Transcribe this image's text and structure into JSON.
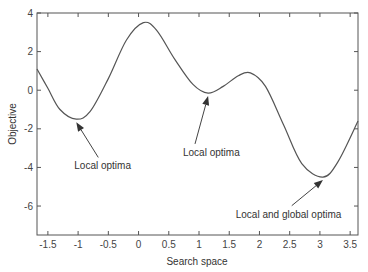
{
  "chart_data": {
    "type": "line",
    "title": "",
    "xlabel": "Search space",
    "ylabel": "Objective",
    "xlim": [
      -1.68,
      3.63
    ],
    "ylim": [
      -7.5,
      4
    ],
    "xticks": [
      -1.5,
      -1,
      -0.5,
      0,
      0.5,
      1,
      1.5,
      2,
      2.5,
      3,
      3.5
    ],
    "xtick_labels": [
      "-1.5",
      "-1",
      "-0.5",
      "0",
      "0.5",
      "1",
      "1.5",
      "2",
      "2.5",
      "3",
      "3.5"
    ],
    "yticks": [
      4,
      2,
      0,
      -2,
      -4,
      -6
    ],
    "ytick_labels": [
      "4",
      "2",
      "0",
      "-2",
      "-4",
      "-6"
    ],
    "grid": false,
    "legend": null,
    "series": [
      {
        "name": "objective",
        "color": "#555555",
        "x": [
          -1.68,
          -1.5,
          -1.3,
          -1.03,
          -0.8,
          -0.5,
          -0.2,
          0.08,
          0.3,
          0.6,
          0.9,
          1.15,
          1.4,
          1.65,
          1.85,
          2.1,
          2.4,
          2.7,
          3.05,
          3.3,
          3.63
        ],
        "y": [
          1.1,
          0.1,
          -1.0,
          -1.5,
          -1.1,
          0.6,
          2.6,
          3.5,
          3.1,
          1.6,
          0.3,
          -0.15,
          0.2,
          0.75,
          0.9,
          0.2,
          -1.8,
          -3.8,
          -4.5,
          -3.7,
          -1.6
        ]
      }
    ],
    "annotations": [
      {
        "text": "Local optima",
        "point": [
          -1.03,
          -1.5
        ],
        "text_pos": [
          -0.6,
          -4.0
        ]
      },
      {
        "text": "Local optima",
        "point": [
          1.15,
          -0.15
        ],
        "text_pos": [
          1.0,
          -3.3
        ]
      },
      {
        "text": "Local and global optima",
        "point": [
          3.05,
          -4.5
        ],
        "text_pos": [
          2.6,
          -6.5
        ]
      }
    ]
  }
}
